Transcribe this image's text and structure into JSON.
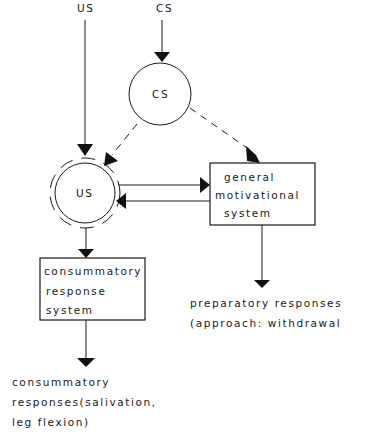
{
  "diagram": {
    "inputs": {
      "us": "US",
      "cs": "CS"
    },
    "nodes": {
      "cs_circle": "CS",
      "us_circle": "US",
      "gms_box": [
        "general",
        "motivational",
        "system"
      ],
      "crs_box": [
        "consummatory",
        "response",
        "system"
      ]
    },
    "outputs": {
      "preparatory": [
        "preparatory responses",
        "(approach: withdrawal"
      ],
      "consummatory": [
        "consummatory",
        "responses(salivation,",
        "leg  flexion)"
      ]
    },
    "edges": [
      {
        "from": "US input",
        "to": "US node",
        "style": "solid"
      },
      {
        "from": "CS input",
        "to": "CS node",
        "style": "solid"
      },
      {
        "from": "CS node",
        "to": "US node",
        "style": "dashed"
      },
      {
        "from": "CS node",
        "to": "general motivational system",
        "style": "dashed"
      },
      {
        "from": "US node",
        "to": "general motivational system",
        "style": "solid"
      },
      {
        "from": "general motivational system",
        "to": "US node",
        "style": "solid"
      },
      {
        "from": "US node",
        "to": "consummatory response system",
        "style": "solid"
      },
      {
        "from": "general motivational system",
        "to": "preparatory responses",
        "style": "solid"
      },
      {
        "from": "consummatory response system",
        "to": "consummatory responses",
        "style": "solid"
      }
    ]
  }
}
